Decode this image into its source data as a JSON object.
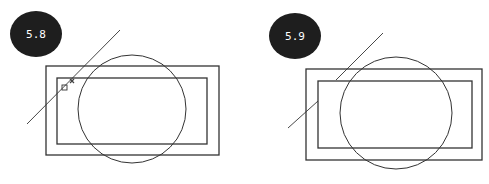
{
  "figures": [
    {
      "label": "5.8",
      "badge": {
        "cx": 36,
        "cy": 34,
        "rx": 26,
        "ry": 23
      },
      "outer_rect": {
        "x": 46,
        "y": 66,
        "w": 173,
        "h": 89
      },
      "inner_rect": {
        "x": 57,
        "y": 78,
        "w": 150,
        "h": 66
      },
      "circle": {
        "cx": 132,
        "cy": 109,
        "r": 54
      },
      "line": {
        "x1": 27,
        "y1": 124,
        "x2": 120,
        "y2": 30
      },
      "snap_square": {
        "x": 62,
        "y": 85,
        "size": 5
      },
      "snap_x_marker": {
        "x": 72,
        "y": 81
      }
    },
    {
      "label": "5.9",
      "badge": {
        "cx": 295,
        "cy": 36,
        "rx": 26,
        "ry": 23
      },
      "outer_rect": {
        "x": 306,
        "y": 69,
        "w": 176,
        "h": 91
      },
      "inner_rect": {
        "x": 318,
        "y": 81,
        "w": 154,
        "h": 67
      },
      "circle": {
        "cx": 396,
        "cy": 113,
        "r": 56
      },
      "line_segments": [
        {
          "x1": 288,
          "y1": 128,
          "x2": 318,
          "y2": 101
        },
        {
          "x1": 336,
          "y1": 80,
          "x2": 383,
          "y2": 33
        }
      ]
    }
  ],
  "colors": {
    "badge_fill": "#1e1e1e",
    "stroke": "#333333",
    "badge_text": "#ffffff"
  }
}
